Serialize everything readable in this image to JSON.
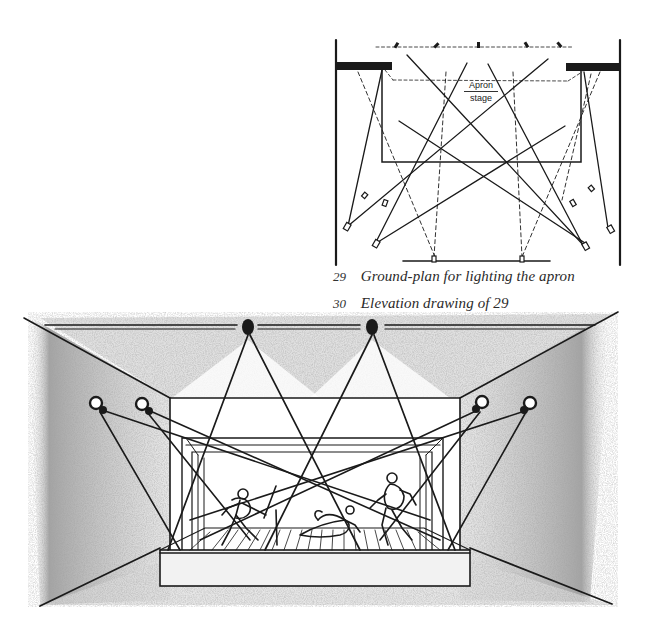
{
  "figures": {
    "ground_plan": {
      "stage_label_line1": "Apron",
      "stage_label_line2": "stage",
      "description": "Ground-plan diagram with light beams crossing the apron stage"
    },
    "elevation": {
      "description": "Perspective sketch of stage with crossing spotlight beams and three figures fighting"
    }
  },
  "captions": [
    {
      "number": "29",
      "text": "Ground-plan for lighting the apron"
    },
    {
      "number": "30",
      "text": "Elevation drawing of 29"
    }
  ],
  "colors": {
    "ink": "#1a1a1a",
    "paper": "#ffffff",
    "shading": "#bdbdbd"
  }
}
